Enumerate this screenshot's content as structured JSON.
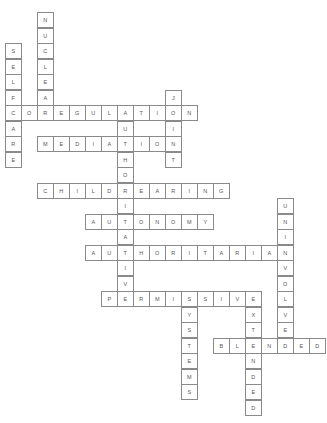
{
  "puzzle": {
    "type": "crossword",
    "cell_width": 16,
    "cell_height": 15.5,
    "origin_x": 5,
    "origin_y": 12,
    "colors": {
      "border": "#8a8a8a",
      "letter": "#555555",
      "background": "#ffffff"
    },
    "words": [
      {
        "word": "NUCLEAR",
        "direction": "down",
        "col": 2,
        "row": 0
      },
      {
        "word": "SELFCARE",
        "direction": "down",
        "col": 0,
        "row": 2
      },
      {
        "word": "COREGULATION",
        "direction": "across",
        "col": 0,
        "row": 6
      },
      {
        "word": "JOINT",
        "direction": "down",
        "col": 10,
        "row": 5
      },
      {
        "word": "MEDIATION",
        "direction": "across",
        "col": 2,
        "row": 8
      },
      {
        "word": "AUTHORITATIVE",
        "direction": "down",
        "col": 7,
        "row": 6
      },
      {
        "word": "CHILDREARING",
        "direction": "across",
        "col": 2,
        "row": 11
      },
      {
        "word": "AUTONOMY",
        "direction": "across",
        "col": 5,
        "row": 13
      },
      {
        "word": "AUTHORITARIAN",
        "direction": "across",
        "col": 5,
        "row": 15
      },
      {
        "word": "UNINVOLVED",
        "direction": "down",
        "col": 17,
        "row": 12
      },
      {
        "word": "PERMISSIVE",
        "direction": "across",
        "col": 6,
        "row": 18
      },
      {
        "word": "SYSTEMS",
        "direction": "down",
        "col": 11,
        "row": 18
      },
      {
        "word": "EXTENDED",
        "direction": "down",
        "col": 15,
        "row": 18
      },
      {
        "word": "BLENDED",
        "direction": "across",
        "col": 13,
        "row": 21
      }
    ]
  }
}
